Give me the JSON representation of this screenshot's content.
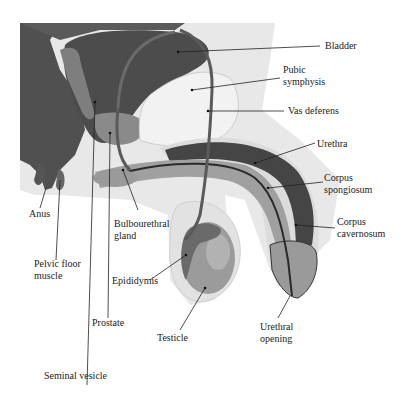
{
  "diagram": {
    "type": "anatomical-sagittal-section",
    "palette": {
      "background": "#ffffff",
      "dark_tissue": "#4a4a4a",
      "mid_tissue": "#7a7a7a",
      "light_tissue": "#c8c8c8",
      "pale_tissue": "#e6e6e6",
      "leader_line": "#222222"
    },
    "labels": [
      {
        "id": "bladder",
        "text": "Bladder"
      },
      {
        "id": "pubic-symphysis",
        "text": "Pubic\nsymphysis"
      },
      {
        "id": "vas-deferens",
        "text": "Vas deferens"
      },
      {
        "id": "urethra",
        "text": "Urethra"
      },
      {
        "id": "corpus-spongiosum",
        "text": "Corpus\nspongiosum"
      },
      {
        "id": "corpus-cavernosum",
        "text": "Corpus\ncavernosum"
      },
      {
        "id": "anus",
        "text": "Anus"
      },
      {
        "id": "bulbourethral-gland",
        "text": "Bulbourethral\ngland"
      },
      {
        "id": "pelvic-floor-muscle",
        "text": "Pelvic floor\nmuscle"
      },
      {
        "id": "epididymis",
        "text": "Epididymis"
      },
      {
        "id": "prostate",
        "text": "Prostate"
      },
      {
        "id": "testicle",
        "text": "Testicle"
      },
      {
        "id": "urethral-opening",
        "text": "Urethral\nopening"
      },
      {
        "id": "seminal-vesicle",
        "text": "Seminal vesicle"
      }
    ]
  }
}
